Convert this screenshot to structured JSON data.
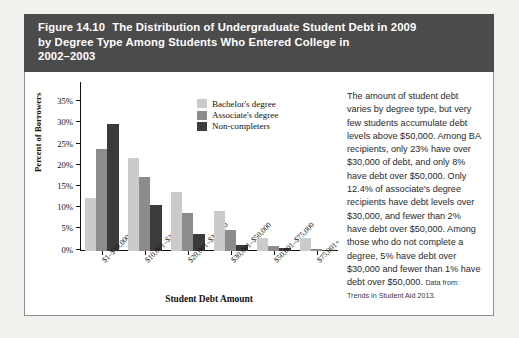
{
  "figure": {
    "number": "Figure 14.10",
    "title": "The Distribution of Undergraduate Student Debt in 2009\nby Degree Type Among Students Who Entered College in\n2002–2003"
  },
  "caption": {
    "body": "The amount of student debt varies by degree type, but very few students accumulate debt levels above $50,000. Among BA recipients, only 23% have over $30,000 of debt, and only 8% have debt over $50,000. Only 12.4% of associate's degree recipients have debt levels over $30,000, and fewer than 2% have debt over $50,000. Among those who do not complete a degree, 5% have debt over $30,000 and fewer than 1% have debt over $50,000. ",
    "source": "Data from: Trends in Student Aid 2013."
  },
  "colors": {
    "header_band": "#4b4b4b",
    "bachelors": "#cbcbcb",
    "associates": "#8c8c8c",
    "non_completers": "#3b3b3b",
    "page_background": "#f2f1ed",
    "panel": "#ffffff"
  },
  "chart_data": {
    "type": "bar",
    "title": "",
    "xlabel": "Student Debt Amount",
    "ylabel": "Percent of Borrowers",
    "ylim": [
      0,
      37
    ],
    "yticks": [
      0,
      5,
      10,
      15,
      20,
      25,
      30,
      35
    ],
    "ytick_labels": [
      "0%",
      "5%",
      "10%",
      "15%",
      "20%",
      "25%",
      "30%",
      "35%"
    ],
    "grid": false,
    "legend_position": "top-center",
    "categories": [
      "$1–$10,000",
      "$10,001–$20,000",
      "$20,001–$30,000",
      "$30,001–$50,000",
      "$50,001–$75,000",
      "$75,001+"
    ],
    "series": [
      {
        "name": "Bachelor's degree",
        "color": "#cbcbcb",
        "values": [
          12.4,
          22.0,
          13.8,
          9.5,
          3.0,
          3.0
        ]
      },
      {
        "name": "Associate's degree",
        "color": "#8c8c8c",
        "values": [
          24.0,
          17.5,
          9.0,
          5.0,
          1.2,
          0.4
        ]
      },
      {
        "name": "Non-completers",
        "color": "#3b3b3b",
        "values": [
          30.0,
          10.8,
          4.0,
          1.5,
          0.6,
          0.3
        ]
      }
    ]
  }
}
